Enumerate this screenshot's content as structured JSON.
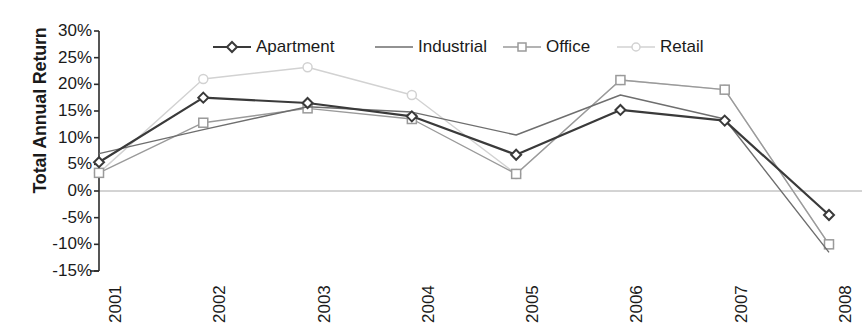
{
  "chart_data": {
    "type": "line",
    "title": "",
    "xlabel": "",
    "ylabel": "Total Annual Return",
    "categories": [
      "2001",
      "2002",
      "2003",
      "2004",
      "2005",
      "2006",
      "2007",
      "2008"
    ],
    "ylim": [
      -15,
      30
    ],
    "ytick_labels": [
      "30%",
      "25%",
      "20%",
      "15%",
      "10%",
      "5%",
      "0%",
      "-5%",
      "-10%",
      "-15%"
    ],
    "ytick_values": [
      30,
      25,
      20,
      15,
      10,
      5,
      0,
      -5,
      -10,
      -15
    ],
    "grid": false,
    "legend_position": "top",
    "zero_line": true,
    "series": [
      {
        "name": "Apartment",
        "marker": "diamond",
        "color": "#3a3a3a",
        "values": [
          5.4,
          17.5,
          16.5,
          14.0,
          6.8,
          15.2,
          13.2,
          -4.5
        ]
      },
      {
        "name": "Industrial",
        "marker": "none",
        "color": "#6e6e6e",
        "values": [
          7.0,
          11.5,
          15.8,
          14.8,
          10.5,
          18.0,
          13.5,
          -11.5
        ]
      },
      {
        "name": "Office",
        "marker": "square",
        "color": "#9a9a9a",
        "values": [
          3.4,
          12.8,
          15.5,
          13.5,
          3.2,
          20.8,
          19.0,
          -10.0
        ]
      },
      {
        "name": "Retail",
        "marker": "circle",
        "color": "#d2d2d2",
        "values": [
          3.4,
          21.0,
          23.2,
          18.0,
          3.2,
          20.8,
          19.0,
          -10.0
        ]
      }
    ]
  },
  "legend": {
    "entries": [
      "Apartment",
      "Industrial",
      "Office",
      "Retail"
    ]
  }
}
